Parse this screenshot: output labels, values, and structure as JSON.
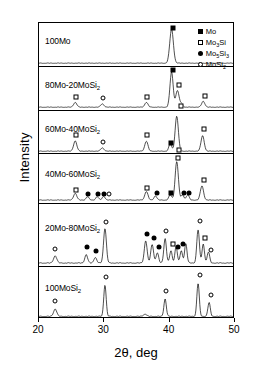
{
  "axes": {
    "xlabel": "2θ,  deg",
    "ylabel": "Intensity",
    "xticks": [
      "20",
      "30",
      "40",
      "50"
    ],
    "xlim": [
      20,
      50
    ],
    "grid": false
  },
  "legend": {
    "position": "top-right",
    "entries": [
      {
        "symbol": "filled-square",
        "label_main": "Mo",
        "label_sub": "",
        "label_tail": ""
      },
      {
        "symbol": "open-square",
        "label_main": "Mo",
        "label_sub": "3",
        "label_tail": "Si"
      },
      {
        "symbol": "filled-circle",
        "label_main": "Mo",
        "label_sub": "5",
        "label_tail": "Si",
        "label_sub2": "3"
      },
      {
        "symbol": "open-circle",
        "label_main": "MoSi",
        "label_sub": "2",
        "label_tail": ""
      }
    ]
  },
  "chart_data": {
    "type": "line",
    "title": "",
    "xlabel": "2θ,  deg",
    "ylabel": "Intensity",
    "xlim": [
      20,
      50
    ],
    "panels": [
      {
        "label_main": "100Mo",
        "label_sub": "",
        "peaks": [
          {
            "x": 40.5,
            "h": 0.92,
            "w": 0.45
          }
        ],
        "markers": [
          {
            "x": 40.5,
            "y": 0.97,
            "symbol": "filled-square"
          }
        ]
      },
      {
        "label_main": "80Mo-20MoSi",
        "label_sub": "2",
        "peaks": [
          {
            "x": 25.6,
            "h": 0.13,
            "w": 0.4
          },
          {
            "x": 29.8,
            "h": 0.09,
            "w": 0.4
          },
          {
            "x": 36.6,
            "h": 0.13,
            "w": 0.4
          },
          {
            "x": 40.5,
            "h": 0.95,
            "w": 0.4
          },
          {
            "x": 41.4,
            "h": 0.45,
            "w": 0.4
          },
          {
            "x": 42.0,
            "h": 0.1,
            "w": 0.35
          },
          {
            "x": 45.4,
            "h": 0.16,
            "w": 0.4
          }
        ],
        "markers": [
          {
            "x": 25.6,
            "y": 0.3,
            "symbol": "open-square"
          },
          {
            "x": 29.8,
            "y": 0.27,
            "symbol": "open-circle"
          },
          {
            "x": 36.6,
            "y": 0.3,
            "symbol": "open-square"
          },
          {
            "x": 40.5,
            "y": 1.02,
            "symbol": "filled-square"
          },
          {
            "x": 41.5,
            "y": 0.62,
            "symbol": "open-square"
          },
          {
            "x": 41.8,
            "y": 0.05,
            "symbol": "open-square"
          },
          {
            "x": 45.4,
            "y": 0.33,
            "symbol": "open-square"
          }
        ]
      },
      {
        "label_main": "60Mo-40MoSi",
        "label_sub": "2",
        "peaks": [
          {
            "x": 25.6,
            "h": 0.28,
            "w": 0.4
          },
          {
            "x": 29.8,
            "h": 0.09,
            "w": 0.4
          },
          {
            "x": 36.6,
            "h": 0.27,
            "w": 0.4
          },
          {
            "x": 40.3,
            "h": 0.2,
            "w": 0.35
          },
          {
            "x": 41.3,
            "h": 0.95,
            "w": 0.4
          },
          {
            "x": 45.3,
            "h": 0.42,
            "w": 0.4
          }
        ],
        "markers": [
          {
            "x": 25.6,
            "y": 0.45,
            "symbol": "open-square"
          },
          {
            "x": 29.8,
            "y": 0.27,
            "symbol": "open-circle"
          },
          {
            "x": 36.6,
            "y": 0.45,
            "symbol": "open-square"
          },
          {
            "x": 40.2,
            "y": 0.24,
            "symbol": "filled-square"
          },
          {
            "x": 41.4,
            "y": 0.05,
            "symbol": "open-square"
          },
          {
            "x": 45.3,
            "y": 0.6,
            "symbol": "open-square"
          }
        ]
      },
      {
        "label_main": "40Mo-60MoSi",
        "label_sub": "2",
        "peaks": [
          {
            "x": 25.6,
            "h": 0.16,
            "w": 0.4
          },
          {
            "x": 27.5,
            "h": 0.08,
            "w": 0.35
          },
          {
            "x": 29.0,
            "h": 0.08,
            "w": 0.35
          },
          {
            "x": 30.0,
            "h": 0.09,
            "w": 0.35
          },
          {
            "x": 36.6,
            "h": 0.2,
            "w": 0.4
          },
          {
            "x": 38.0,
            "h": 0.1,
            "w": 0.35
          },
          {
            "x": 40.3,
            "h": 0.12,
            "w": 0.35
          },
          {
            "x": 41.3,
            "h": 0.9,
            "w": 0.4
          },
          {
            "x": 42.2,
            "h": 0.12,
            "w": 0.35
          },
          {
            "x": 43.0,
            "h": 0.12,
            "w": 0.35
          },
          {
            "x": 45.2,
            "h": 0.33,
            "w": 0.4
          }
        ],
        "markers": [
          {
            "x": 25.6,
            "y": 0.26,
            "symbol": "open-square"
          },
          {
            "x": 27.5,
            "y": 0.17,
            "symbol": "filled-circle"
          },
          {
            "x": 29.0,
            "y": 0.17,
            "symbol": "filled-circle"
          },
          {
            "x": 29.9,
            "y": 0.17,
            "symbol": "filled-circle"
          },
          {
            "x": 30.7,
            "y": 0.17,
            "symbol": "open-circle"
          },
          {
            "x": 36.6,
            "y": 0.31,
            "symbol": "open-square"
          },
          {
            "x": 38.0,
            "y": 0.19,
            "symbol": "filled-circle"
          },
          {
            "x": 40.2,
            "y": 0.2,
            "symbol": "filled-square"
          },
          {
            "x": 41.3,
            "y": 1.0,
            "symbol": "open-square"
          },
          {
            "x": 42.2,
            "y": 0.2,
            "symbol": "filled-circle"
          },
          {
            "x": 43.0,
            "y": 0.2,
            "symbol": "filled-circle"
          },
          {
            "x": 45.2,
            "y": 0.5,
            "symbol": "open-square"
          }
        ]
      },
      {
        "label_main": "20Mo-80MoSi",
        "label_sub": "2",
        "peaks": [
          {
            "x": 22.5,
            "h": 0.13,
            "w": 0.4
          },
          {
            "x": 27.3,
            "h": 0.15,
            "w": 0.35
          },
          {
            "x": 28.7,
            "h": 0.1,
            "w": 0.35
          },
          {
            "x": 30.2,
            "h": 0.62,
            "w": 0.35
          },
          {
            "x": 36.5,
            "h": 0.4,
            "w": 0.35
          },
          {
            "x": 37.5,
            "h": 0.33,
            "w": 0.35
          },
          {
            "x": 38.3,
            "h": 0.18,
            "w": 0.32
          },
          {
            "x": 39.5,
            "h": 0.44,
            "w": 0.32
          },
          {
            "x": 40.4,
            "h": 0.22,
            "w": 0.3
          },
          {
            "x": 41.2,
            "h": 0.3,
            "w": 0.3
          },
          {
            "x": 42.0,
            "h": 0.22,
            "w": 0.3
          },
          {
            "x": 42.7,
            "h": 0.35,
            "w": 0.3
          },
          {
            "x": 44.6,
            "h": 0.6,
            "w": 0.32
          },
          {
            "x": 45.4,
            "h": 0.34,
            "w": 0.3
          },
          {
            "x": 46.2,
            "h": 0.2,
            "w": 0.3
          }
        ],
        "markers": [
          {
            "x": 22.5,
            "y": 0.27,
            "symbol": "open-circle"
          },
          {
            "x": 27.3,
            "y": 0.3,
            "symbol": "filled-circle"
          },
          {
            "x": 28.7,
            "y": 0.23,
            "symbol": "filled-circle"
          },
          {
            "x": 30.2,
            "y": 0.74,
            "symbol": "open-circle"
          },
          {
            "x": 36.5,
            "y": 0.54,
            "symbol": "filled-circle"
          },
          {
            "x": 37.6,
            "y": 0.46,
            "symbol": "filled-circle"
          },
          {
            "x": 38.4,
            "y": 0.3,
            "symbol": "filled-circle"
          },
          {
            "x": 39.5,
            "y": 0.58,
            "symbol": "open-circle"
          },
          {
            "x": 40.5,
            "y": 0.36,
            "symbol": "open-square"
          },
          {
            "x": 41.3,
            "y": 0.3,
            "symbol": "filled-circle"
          },
          {
            "x": 42.0,
            "y": 0.36,
            "symbol": "filled-circle"
          },
          {
            "x": 44.6,
            "y": 0.76,
            "symbol": "open-circle"
          },
          {
            "x": 45.4,
            "y": 0.47,
            "symbol": "open-square"
          },
          {
            "x": 46.3,
            "y": 0.25,
            "symbol": "open-circle"
          }
        ]
      },
      {
        "label_main": "100MoSi",
        "label_sub": "2",
        "peaks": [
          {
            "x": 22.5,
            "h": 0.16,
            "w": 0.4
          },
          {
            "x": 30.2,
            "h": 0.68,
            "w": 0.3
          },
          {
            "x": 36.4,
            "h": 0.05,
            "w": 0.4
          },
          {
            "x": 39.5,
            "h": 0.38,
            "w": 0.3
          },
          {
            "x": 44.6,
            "h": 0.72,
            "w": 0.3
          },
          {
            "x": 46.3,
            "h": 0.3,
            "w": 0.3
          }
        ],
        "markers": [
          {
            "x": 22.5,
            "y": 0.33,
            "symbol": "open-circle"
          },
          {
            "x": 30.2,
            "y": 0.85,
            "symbol": "open-circle"
          },
          {
            "x": 39.5,
            "y": 0.55,
            "symbol": "open-circle"
          },
          {
            "x": 44.6,
            "y": 0.89,
            "symbol": "open-circle"
          },
          {
            "x": 46.3,
            "y": 0.47,
            "symbol": "open-circle"
          }
        ]
      }
    ]
  }
}
